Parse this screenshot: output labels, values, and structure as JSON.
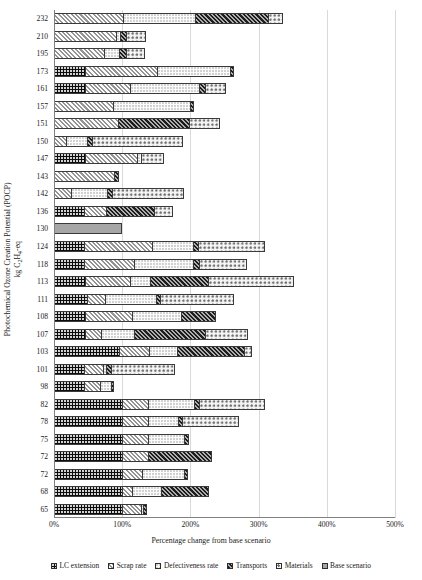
{
  "chart_data": {
    "type": "bar",
    "orientation": "horizontal",
    "stacked": true,
    "title": "",
    "xlabel": "Percentage change from base scenario",
    "ylabel": "Photochemical Ozone Creation Potential (POCP) kg C2H4-eq",
    "ylabel_line1": "Photochemical Ozone Creation Potential (POCP)",
    "ylabel_line2_pre": "kg C",
    "ylabel_line2_sub": "2",
    "ylabel_line2_mid": "H",
    "ylabel_line2_sub2": "4",
    "ylabel_line2_post": "-eq",
    "xlim": [
      0,
      500
    ],
    "xunit": "%",
    "xticks": [
      0,
      100,
      200,
      300,
      400,
      500
    ],
    "xticklabels": [
      "0%",
      "100%",
      "200%",
      "300%",
      "400%",
      "500%"
    ],
    "grid": "vertical",
    "legend_position": "bottom",
    "series": [
      {
        "name": "LC extension",
        "key": "s0",
        "values": [
          0,
          0,
          0,
          45,
          46,
          0,
          0,
          0,
          45,
          0,
          0,
          44,
          0,
          44,
          44,
          45,
          48,
          45,
          45,
          95,
          44,
          44,
          100,
          100,
          100,
          100,
          100,
          100,
          100
        ]
      },
      {
        "name": "Scrap rate",
        "key": "s1",
        "values": [
          101,
          91,
          74,
          106,
          66,
          86,
          94,
          18,
          77,
          88,
          25,
          32,
          0,
          100,
          74,
          66,
          27,
          70,
          24,
          45,
          28,
          24,
          38,
          38,
          38,
          38,
          29,
          15,
          27
        ]
      },
      {
        "name": "Defectiveness rate",
        "key": "s2",
        "values": [
          106,
          6,
          22,
          107,
          100,
          114,
          0,
          30,
          6,
          0,
          52,
          0,
          0,
          60,
          86,
          30,
          75,
          71,
          49,
          40,
          4,
          15,
          67,
          44,
          53,
          0,
          62,
          42,
          3
        ]
      },
      {
        "name": "Transports",
        "key": "s3",
        "values": [
          107,
          8,
          9,
          6,
          9,
          6,
          104,
          8,
          0,
          8,
          8,
          71,
          0,
          7,
          8,
          85,
          6,
          52,
          104,
          98,
          7,
          5,
          7,
          6,
          7,
          93,
          6,
          71,
          7
        ]
      },
      {
        "name": "Materials",
        "key": "s4",
        "values": [
          22,
          30,
          28,
          0,
          32,
          0,
          46,
          133,
          33,
          0,
          105,
          28,
          0,
          98,
          71,
          126,
          108,
          0,
          63,
          13,
          94,
          0,
          97,
          83,
          0,
          0,
          0,
          0,
          0
        ]
      },
      {
        "name": "Base scenario",
        "key": "s5",
        "values": [
          0,
          0,
          0,
          0,
          0,
          0,
          0,
          0,
          0,
          0,
          0,
          0,
          100,
          0,
          0,
          0,
          0,
          0,
          0,
          0,
          0,
          0,
          0,
          0,
          0,
          0,
          0,
          0,
          0
        ]
      }
    ],
    "categories": [
      "232",
      "210",
      "195",
      "173",
      "161",
      "157",
      "151",
      "150",
      "147",
      "143",
      "142",
      "136",
      "130",
      "124",
      "118",
      "113",
      "111",
      "108",
      "107",
      "103",
      "101",
      "98",
      "82",
      "78",
      "75",
      "72",
      "72",
      "68",
      "65"
    ],
    "totals": [
      336,
      135,
      133,
      264,
      253,
      206,
      244,
      189,
      161,
      96,
      190,
      175,
      100,
      309,
      283,
      352,
      264,
      238,
      285,
      291,
      177,
      88,
      309,
      271,
      198,
      231,
      197,
      228,
      137
    ]
  },
  "legend": {
    "items": [
      {
        "label": "LC extension",
        "key": "s0"
      },
      {
        "label": "Scrap rate",
        "key": "s1"
      },
      {
        "label": "Defectiveness rate",
        "key": "s2"
      },
      {
        "label": "Transports",
        "key": "s3"
      },
      {
        "label": "Materials",
        "key": "s4"
      },
      {
        "label": "Base scenario",
        "key": "s5"
      }
    ]
  }
}
